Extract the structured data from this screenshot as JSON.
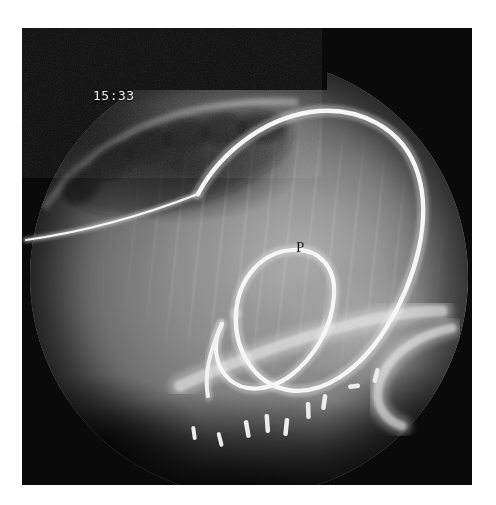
{
  "document": {
    "type": "fluoroscopic-radiograph",
    "modality": "Fluoroscopy / X-ray",
    "view": "lateral abdominal",
    "background_color": "#ffffff",
    "plate_color": "#0a0a0a"
  },
  "overlay": {
    "timestamp": "15:33",
    "timestamp_color": "#e9e9e9",
    "anatomic_marker": "P",
    "marker_color": "#1b1b1b"
  },
  "field_of_view": {
    "shape": "circle",
    "collimator_mask": "rectangular black mask over upper-left quadrant",
    "tissue_tone": "#8a8a8a",
    "rim_tone": "#2e2e2e"
  },
  "findings": {
    "devices": [
      {
        "name": "catheter-main-loop",
        "description": "Large radio-opaque catheter forming a broad loop across the mid field",
        "color": "#f2f2f2"
      },
      {
        "name": "catheter-inner-loop",
        "description": "Smaller inner pigtail loop adjacent to marker P",
        "color": "#f2f2f2"
      },
      {
        "name": "guidewire-entry",
        "description": "Thin guidewire entering from the left margin",
        "color": "#e6e6e6"
      },
      {
        "name": "tubular-device",
        "description": "Broad tubular structure crossing the lower field diagonally",
        "color": "#cfcfcf"
      },
      {
        "name": "tubular-device-right",
        "description": "Curved tubular device tip at the right lower field",
        "color": "#cfcfcf"
      }
    ],
    "surgical_clips": {
      "name": "surgical-clips",
      "count": 9,
      "description": "Cluster of radio-opaque surgical clips along the lower field",
      "color": "#ededed"
    },
    "anatomy": [
      {
        "name": "rib-shadows",
        "description": "Serrated rib/vertebral shadows along the upper-left arc"
      },
      {
        "name": "soft-tissue",
        "description": "Homogeneous soft-tissue density filling the mid field"
      },
      {
        "name": "diaphragm-shadow",
        "description": "Dense dark band across the lower field"
      }
    ]
  }
}
